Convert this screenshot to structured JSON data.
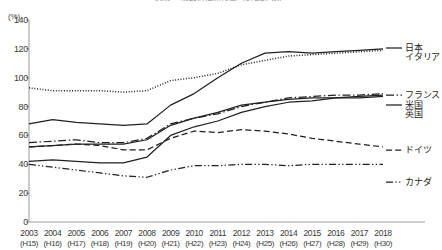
{
  "chart_data": {
    "type": "line",
    "title": "図表 一般政府債務残高（対GDP比）",
    "unit_label": "(%)",
    "xlabel": "",
    "ylabel": "",
    "ylim": [
      0,
      140
    ],
    "ytick_step": 20,
    "yticks": [
      0,
      20,
      40,
      60,
      80,
      100,
      120,
      140
    ],
    "grid": false,
    "legend_position": "right",
    "x": [
      2003,
      2004,
      2005,
      2006,
      2007,
      2008,
      2009,
      2010,
      2011,
      2012,
      2013,
      2014,
      2015,
      2016,
      2017,
      2018
    ],
    "xtick_labels": [
      "2003",
      "2004",
      "2005",
      "2006",
      "2007",
      "2008",
      "2009",
      "2010",
      "2011",
      "2012",
      "2013",
      "2014",
      "2015",
      "2016",
      "2017",
      "2018"
    ],
    "xtick_sublabels": [
      "(H15)",
      "(H16)",
      "(H17)",
      "(H18)",
      "(H19)",
      "(H20)",
      "(H21)",
      "(H22)",
      "(H23)",
      "(H24)",
      "(H25)",
      "(H26)",
      "(H27)",
      "(H28)",
      "(H29)",
      "(H30)"
    ],
    "series": [
      {
        "name": "日本",
        "style": "solid",
        "values": [
          68,
          71,
          69,
          68,
          67,
          68,
          81,
          89,
          100,
          110,
          117,
          118,
          117,
          118,
          119,
          120
        ]
      },
      {
        "name": "イタリア",
        "style": "dotted",
        "values": [
          93,
          91,
          91,
          91,
          90,
          91,
          98,
          100,
          103,
          109,
          112,
          115,
          116,
          117,
          118,
          119
        ]
      },
      {
        "name": "フランス",
        "style": "dash-dot",
        "values": [
          55,
          56,
          57,
          55,
          55,
          58,
          68,
          72,
          75,
          80,
          83,
          86,
          87,
          88,
          88,
          89
        ]
      },
      {
        "name": "米国",
        "style": "solid",
        "values": [
          42,
          43,
          42,
          41,
          41,
          45,
          60,
          66,
          70,
          76,
          80,
          83,
          84,
          86,
          87,
          88
        ]
      },
      {
        "name": "英国",
        "style": "solid",
        "values": [
          52,
          53,
          54,
          54,
          54,
          57,
          67,
          72,
          76,
          81,
          83,
          85,
          86,
          86,
          86,
          87
        ]
      },
      {
        "name": "ドイツ",
        "style": "dashed",
        "values": [
          52,
          53,
          54,
          53,
          50,
          50,
          58,
          63,
          62,
          64,
          63,
          61,
          58,
          56,
          54,
          52
        ]
      },
      {
        "name": "カナダ",
        "style": "dash-dot-dot",
        "values": [
          40,
          38,
          36,
          34,
          32,
          31,
          36,
          39,
          39,
          40,
          40,
          39,
          40,
          40,
          40,
          40
        ]
      }
    ],
    "legend_entries": [
      {
        "name": "日本",
        "style": "solid"
      },
      {
        "name": "イタリア",
        "style": "dotted"
      },
      {
        "name": "フランス",
        "style": "dash-dot"
      },
      {
        "name": "米国",
        "style": "solid"
      },
      {
        "name": "英国",
        "style": "solid"
      },
      {
        "name": "ドイツ",
        "style": "dashed"
      },
      {
        "name": "カナダ",
        "style": "dash-dot-dot"
      }
    ]
  }
}
